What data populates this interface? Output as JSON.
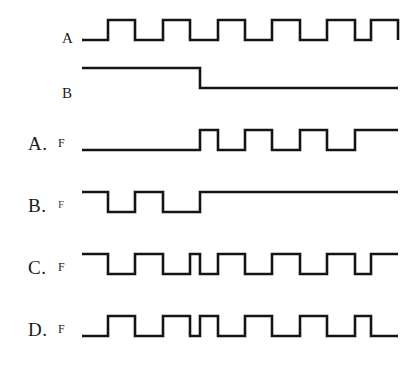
{
  "figure": {
    "kind": "digital-timing-diagram",
    "background_color": "#ffffff",
    "stroke_color": "#141414",
    "stroke_width": 2.6,
    "width": 413,
    "height": 367,
    "geometry": {
      "wave_left_x": 82,
      "wave_right_x": 398,
      "unit": 27.3,
      "mid_x": 200
    }
  },
  "rows": [
    {
      "id": "ref-a",
      "option_label": "",
      "signal_label": "A",
      "signal_label_size": "big",
      "label_x": 62,
      "label_y": 31,
      "row_top": 14,
      "row_height": 34,
      "high_y": 6,
      "low_y": 26,
      "description": "Clock A: starts low, six equal-width high pulses, ends low",
      "levels": [
        0,
        1,
        0,
        1,
        0,
        1,
        0,
        1,
        0,
        1,
        0,
        1,
        0
      ],
      "edge_x": [
        82,
        108,
        135,
        163,
        190,
        218,
        245,
        272,
        300,
        327,
        355,
        371,
        398
      ]
    },
    {
      "id": "ref-b",
      "option_label": "",
      "signal_label": "B",
      "signal_label_size": "big",
      "label_x": 62,
      "label_y": 86,
      "row_top": 62,
      "row_height": 34,
      "high_y": 6,
      "low_y": 26,
      "description": "Control B: high until mid, then low for remainder",
      "levels": [
        1,
        0
      ],
      "edge_x": [
        82,
        200,
        398
      ]
    },
    {
      "id": "option-a",
      "option_label": "A.",
      "signal_label": "F",
      "signal_label_size": "small",
      "label_x": 28,
      "label_y": 134,
      "row_top": 124,
      "row_height": 34,
      "high_y": 6,
      "low_y": 26,
      "description": "F low until mid, then pulses high",
      "levels": [
        0,
        1,
        0,
        1,
        0,
        1,
        0,
        1
      ],
      "edge_x": [
        82,
        200,
        218,
        245,
        272,
        300,
        327,
        355,
        398
      ]
    },
    {
      "id": "option-b",
      "option_label": "B.",
      "signal_label": "F",
      "signal_label_size": "faint",
      "label_x": 28,
      "label_y": 196,
      "row_top": 186,
      "row_height": 34,
      "high_y": 6,
      "low_y": 26,
      "description": "F high with two low pulses before mid, then high",
      "levels": [
        1,
        0,
        1,
        0,
        1
      ],
      "edge_x": [
        82,
        108,
        135,
        163,
        200,
        398
      ]
    },
    {
      "id": "option-c",
      "option_label": "C.",
      "signal_label": "F",
      "signal_label_size": "small",
      "label_x": 28,
      "label_y": 258,
      "row_top": 248,
      "row_height": 34,
      "high_y": 6,
      "low_y": 26,
      "description": "F is inverted clock A: starts high, alternating, narrow high pulse at mid",
      "levels": [
        1,
        0,
        1,
        0,
        1,
        0,
        1,
        0,
        1,
        0,
        1,
        0,
        1
      ],
      "edge_x": [
        82,
        108,
        135,
        163,
        190,
        200,
        218,
        245,
        272,
        300,
        327,
        355,
        371,
        398
      ]
    },
    {
      "id": "option-d",
      "option_label": "D.",
      "signal_label": "F",
      "signal_label_size": "small",
      "label_x": 28,
      "label_y": 320,
      "row_top": 310,
      "row_height": 34,
      "high_y": 6,
      "low_y": 26,
      "description": "F follows clock A but with a narrow low pulse at mid",
      "levels": [
        0,
        1,
        0,
        1,
        0,
        1,
        0,
        1,
        0,
        1,
        0,
        1,
        0
      ],
      "edge_x": [
        82,
        108,
        135,
        163,
        190,
        200,
        218,
        245,
        272,
        300,
        327,
        355,
        371,
        398
      ]
    }
  ]
}
